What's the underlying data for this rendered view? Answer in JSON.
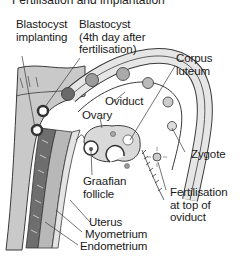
{
  "title": "Fertilisation and implantation",
  "labels": {
    "blastocyst_implanting": [
      "Blastocyst",
      "implanting"
    ],
    "blastocyst_4th_day": [
      "Blastocyst",
      "(4th day after",
      "fertilisation)"
    ],
    "corpus_luteum": [
      "Corpus",
      "luteum"
    ],
    "oviduct": "Oviduct",
    "ovary": "Ovary",
    "zygote": "Zygote",
    "graafian_follicle": [
      "Graafian",
      "follicle"
    ],
    "fertilisation": [
      "Fertilisation",
      "at top of",
      "oviduct"
    ],
    "uterus": "Uterus",
    "myometrium": "Myometrium",
    "endometrium": "Endometrium"
  },
  "colors": {
    "outline": "#3a3a3a",
    "tissue_light": "#d8d8d8",
    "tissue_mid": "#a8a8a8",
    "tissue_dark": "#6e6e6e",
    "cell_fill": "#9a9a9a"
  }
}
